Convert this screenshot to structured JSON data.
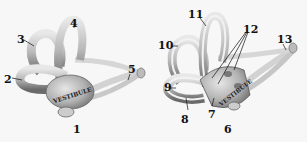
{
  "figures": [
    {
      "id": "left",
      "caption": "1",
      "vestibule_text": "VESTIBULE",
      "labels": [
        {
          "n": "2",
          "x": 4,
          "y": 74
        },
        {
          "n": "3",
          "x": 17,
          "y": 34
        },
        {
          "n": "4",
          "x": 70,
          "y": 18
        },
        {
          "n": "5",
          "x": 128,
          "y": 64
        }
      ],
      "caption_pos": {
        "x": 73,
        "y": 124
      }
    },
    {
      "id": "right",
      "caption": "6",
      "vestibule_text": "VESTIBULE",
      "labels": [
        {
          "n": "7",
          "x": 208,
          "y": 109
        },
        {
          "n": "8",
          "x": 181,
          "y": 114
        },
        {
          "n": "9",
          "x": 167,
          "y": 84
        },
        {
          "n": "10",
          "x": 160,
          "y": 40
        },
        {
          "n": "11",
          "x": 187,
          "y": 9
        },
        {
          "n": "12",
          "x": 243,
          "y": 24
        },
        {
          "n": "13",
          "x": 277,
          "y": 34
        }
      ],
      "caption_pos": {
        "x": 224,
        "y": 124
      }
    }
  ],
  "colors": {
    "background": "#f7f7f7",
    "bone_light": "#e2e2e2",
    "bone_mid": "#a8a8a8",
    "bone_dark": "#555555",
    "ink": "#111111"
  }
}
